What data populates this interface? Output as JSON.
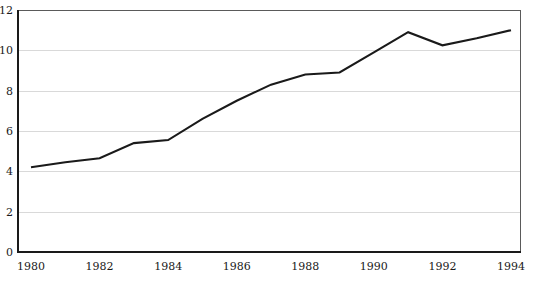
{
  "chart_data": {
    "type": "line",
    "title": "",
    "subtitle": "",
    "xlabel": "",
    "ylabel": "",
    "x": [
      1980,
      1981,
      1982,
      1983,
      1984,
      1985,
      1986,
      1987,
      1988,
      1989,
      1990,
      1991,
      1992,
      1993,
      1994
    ],
    "series": [
      {
        "name": "series-1",
        "values": [
          4.2,
          4.45,
          4.65,
          5.4,
          5.55,
          6.6,
          7.5,
          8.3,
          8.8,
          8.9,
          9.9,
          10.9,
          10.25,
          10.6,
          11.0
        ],
        "color": "#1a1a1a"
      }
    ],
    "xlim": [
      1980,
      1994
    ],
    "ylim": [
      0,
      12
    ],
    "xticks": [
      1980,
      1982,
      1984,
      1986,
      1988,
      1990,
      1992,
      1994
    ],
    "xtick_labels": [
      "1980",
      "1982",
      "1984",
      "1986",
      "1988",
      "1990",
      "1992",
      "1994"
    ],
    "yticks": [
      0,
      2,
      4,
      6,
      8,
      10,
      12
    ],
    "ytick_labels": [
      "0",
      "2",
      "4",
      "6",
      "8",
      "10",
      "12"
    ],
    "grid": {
      "horizontal": true,
      "vertical": false,
      "color": "#d9d9d9"
    },
    "legend": {
      "visible": false,
      "position": "none",
      "entries": []
    },
    "annotations": [],
    "axis_color": "#1a1a1a",
    "plot_border_color": "#5a5a5a",
    "background": "#ffffff"
  }
}
